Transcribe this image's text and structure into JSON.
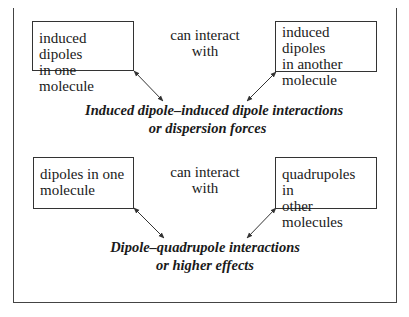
{
  "diagram": {
    "section1": {
      "left_box": [
        "induced dipoles",
        "in one molecule"
      ],
      "connector": [
        "can interact",
        "with"
      ],
      "right_box": [
        "induced dipoles",
        "in another",
        "molecule"
      ],
      "result": [
        "Induced dipole–induced dipole interactions",
        "or dispersion forces"
      ]
    },
    "section2": {
      "left_box": [
        "dipoles in one",
        "molecule"
      ],
      "connector": [
        "can interact",
        "with"
      ],
      "right_box": [
        "quadrupoles in",
        "other molecules"
      ],
      "result": [
        "Dipole–quadrupole interactions",
        "or higher effects"
      ]
    },
    "colors": {
      "line": "#333333",
      "text": "#1a1a1a",
      "background": "#ffffff"
    }
  }
}
